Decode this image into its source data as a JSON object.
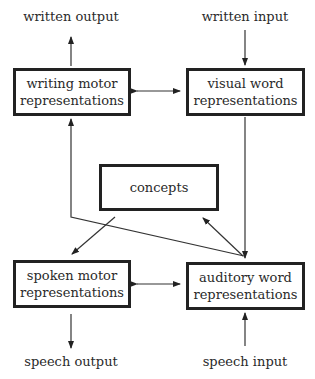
{
  "diagram": {
    "nodes": {
      "writing_motor": {
        "line1": "writing motor",
        "line2": "representations"
      },
      "visual_word": {
        "line1": "visual word",
        "line2": "representations"
      },
      "concepts": {
        "line1": "concepts"
      },
      "spoken_motor": {
        "line1": "spoken motor",
        "line2": "representations"
      },
      "auditory_word": {
        "line1": "auditory word",
        "line2": "representations"
      }
    },
    "terminals": {
      "written_output": "written output",
      "written_input": "written input",
      "speech_output": "speech output",
      "speech_input": "speech input"
    },
    "edges": [
      {
        "from": "writing motor representations",
        "to": "written output"
      },
      {
        "from": "written input",
        "to": "visual word representations"
      },
      {
        "from": "writing motor representations",
        "to": "visual word representations",
        "bidirectional": true
      },
      {
        "from": "visual word representations",
        "to": "auditory word representations"
      },
      {
        "from": "auditory word representations",
        "to": "writing motor representations"
      },
      {
        "from": "auditory word representations",
        "to": "concepts"
      },
      {
        "from": "concepts",
        "to": "spoken motor representations"
      },
      {
        "from": "spoken motor representations",
        "to": "auditory word representations",
        "bidirectional": true
      },
      {
        "from": "spoken motor representations",
        "to": "speech output"
      },
      {
        "from": "speech input",
        "to": "auditory word representations"
      }
    ]
  }
}
